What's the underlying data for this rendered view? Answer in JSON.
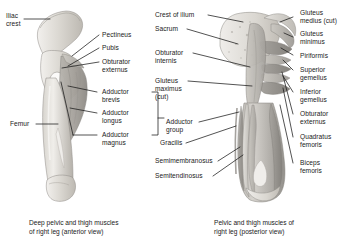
{
  "figure": {
    "type": "anatomical-illustration",
    "panels": [
      {
        "id": "anterior",
        "caption_line1": "Deep pelvic and thigh muscles",
        "caption_line2": "of right leg (anterior view)",
        "labels": [
          {
            "id": "iliac-crest",
            "line1": "Iliac",
            "line2": "crest"
          },
          {
            "id": "pectineus",
            "line1": "Pectineus",
            "line2": ""
          },
          {
            "id": "pubis",
            "line1": "Pubis",
            "line2": ""
          },
          {
            "id": "obturator-externus",
            "line1": "Obturator",
            "line2": "externus"
          },
          {
            "id": "adductor-brevis",
            "line1": "Adductor",
            "line2": "brevis"
          },
          {
            "id": "adductor-longus",
            "line1": "Adductor",
            "line2": "longus"
          },
          {
            "id": "adductor-magnus",
            "line1": "Adductor",
            "line2": "magnus"
          },
          {
            "id": "femur",
            "line1": "Femur",
            "line2": ""
          }
        ]
      },
      {
        "id": "posterior",
        "caption_line1": "Pelvic and thigh muscles of",
        "caption_line2": "right leg (posterior view)",
        "labels_left": [
          {
            "id": "crest-of-ilium",
            "line1": "Crest of ilium",
            "line2": ""
          },
          {
            "id": "sacrum",
            "line1": "Sacrum",
            "line2": ""
          },
          {
            "id": "obturator-internus",
            "line1": "Obturator",
            "line2": "internis"
          },
          {
            "id": "gluteus-maximus-cut",
            "line1": "Gluteus",
            "line2": "maximus",
            "line3": "(cut)"
          },
          {
            "id": "adductor-group",
            "line1": "Adductor",
            "line2": "group"
          },
          {
            "id": "gracilis",
            "line1": "Gracilis",
            "line2": ""
          },
          {
            "id": "semimembranosus",
            "line1": "Semimembranosus",
            "line2": ""
          },
          {
            "id": "semitendinosus",
            "line1": "Semitendinosus",
            "line2": ""
          }
        ],
        "labels_right": [
          {
            "id": "gluteus-medius-cut",
            "line1": "Gluteus",
            "line2": "medius (cut)"
          },
          {
            "id": "gluteus-minimus",
            "line1": "Gluteus",
            "line2": "minimus"
          },
          {
            "id": "piriformis",
            "line1": "Piriformis",
            "line2": ""
          },
          {
            "id": "superior-gemellus",
            "line1": "Superior",
            "line2": "gemellus"
          },
          {
            "id": "inferior-gemellus",
            "line1": "Inferior",
            "line2": "gemellus"
          },
          {
            "id": "obturator-externus-p",
            "line1": "Obturator",
            "line2": "externus"
          },
          {
            "id": "quadratus-femoris",
            "line1": "Quadratus",
            "line2": "femoris"
          },
          {
            "id": "biceps-femoris",
            "line1": "Biceps",
            "line2": "femoris"
          }
        ]
      }
    ],
    "colors": {
      "leader_line": "#1a1a1a",
      "text": "#1a1a1a",
      "bone_light": "#e8e6e1",
      "bone_mid": "#cfcbc4",
      "muscle_dark": "#a9a6a1",
      "muscle_mid": "#bfbcb6",
      "background": "#ffffff"
    }
  }
}
